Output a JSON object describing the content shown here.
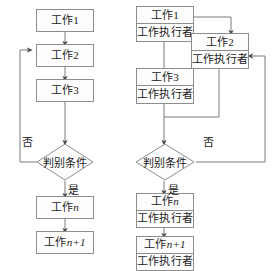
{
  "diagram": {
    "colors": {
      "stroke": "#8d8d8d",
      "wire": "#7a7a7a",
      "fill": "#fdfdfd",
      "text": "#1b1b1b",
      "background": "#ffffff"
    },
    "labels": {
      "executor": "工作执行者",
      "condition": "判别条件",
      "yes": "是",
      "no": "否",
      "work1": "工作1",
      "work2": "工作2",
      "work3": "工作3",
      "workN": "工作n",
      "workN1": "工作n+1"
    }
  },
  "left_chart": {
    "name": "simple-work-flow",
    "nodes": [
      {
        "id": "l-work1",
        "type": "process",
        "label": "工作1"
      },
      {
        "id": "l-work2",
        "type": "process",
        "label": "工作2"
      },
      {
        "id": "l-work3",
        "type": "process",
        "label": "工作3"
      },
      {
        "id": "l-decision",
        "type": "decision",
        "label": "判别条件"
      },
      {
        "id": "l-workn",
        "type": "process",
        "label": "工作n"
      },
      {
        "id": "l-workn1",
        "type": "process",
        "label": "工作n+1"
      }
    ],
    "edges": [
      {
        "from": "l-work1",
        "to": "l-work2",
        "label": ""
      },
      {
        "from": "l-work2",
        "to": "l-work3",
        "label": ""
      },
      {
        "from": "l-work3",
        "to": "l-decision",
        "label": ""
      },
      {
        "from": "l-decision",
        "to": "l-workn",
        "label": "是"
      },
      {
        "from": "l-decision",
        "to": "l-work2",
        "label": "否"
      },
      {
        "from": "l-workn",
        "to": "l-workn1",
        "label": ""
      }
    ]
  },
  "right_chart": {
    "name": "work-with-executor-flow",
    "nodes": [
      {
        "id": "r-work1",
        "type": "process-dual",
        "label": "工作1",
        "sublabel": "工作执行者"
      },
      {
        "id": "r-work2",
        "type": "process-dual",
        "label": "工作2",
        "sublabel": "工作执行者"
      },
      {
        "id": "r-work3",
        "type": "process-dual",
        "label": "工作3",
        "sublabel": "工作执行者"
      },
      {
        "id": "r-decision",
        "type": "decision",
        "label": "判别条件"
      },
      {
        "id": "r-workn",
        "type": "process-dual",
        "label": "工作n",
        "sublabel": "工作执行者"
      },
      {
        "id": "r-workn1",
        "type": "process-dual",
        "label": "工作n+1",
        "sublabel": "工作执行者"
      }
    ],
    "edges": [
      {
        "from": "r-work1",
        "to": "r-work2",
        "label": ""
      },
      {
        "from": "r-work1",
        "to": "r-work3",
        "label": ""
      },
      {
        "from": "r-work2",
        "to": "r-decision",
        "label": ""
      },
      {
        "from": "r-work3",
        "to": "r-decision",
        "label": ""
      },
      {
        "from": "r-decision",
        "to": "r-workn",
        "label": "是"
      },
      {
        "from": "r-decision",
        "to": "r-work2",
        "label": "否"
      },
      {
        "from": "r-workn",
        "to": "r-workn1",
        "label": ""
      }
    ]
  }
}
